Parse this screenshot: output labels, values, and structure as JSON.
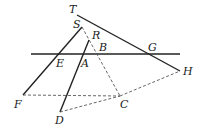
{
  "diagram": {
    "colors": {
      "line": "#222222",
      "dashed": "#555555",
      "background": "#ffffff"
    },
    "points": {
      "T": {
        "label": "T",
        "x": 77,
        "y": 15,
        "lx": 69,
        "ly": 13
      },
      "S": {
        "label": "S",
        "x": 82,
        "y": 27,
        "lx": 73,
        "ly": 28
      },
      "R": {
        "label": "R",
        "x": 89,
        "y": 40,
        "lx": 92,
        "ly": 39
      },
      "B": {
        "label": "B",
        "x": 97,
        "y": 54,
        "lx": 99,
        "ly": 51
      },
      "G": {
        "label": "G",
        "x": 151,
        "y": 54,
        "lx": 148,
        "ly": 51
      },
      "E": {
        "label": "E",
        "x": 59,
        "y": 54,
        "lx": 56,
        "ly": 67
      },
      "A": {
        "label": "A",
        "x": 83,
        "y": 54,
        "lx": 81,
        "ly": 67
      },
      "H": {
        "label": "H",
        "x": 180,
        "y": 71,
        "lx": 183,
        "ly": 75
      },
      "F": {
        "label": "F",
        "x": 23,
        "y": 95,
        "lx": 14,
        "ly": 108
      },
      "C": {
        "label": "C",
        "x": 120,
        "y": 96,
        "lx": 120,
        "ly": 108
      },
      "D": {
        "label": "D",
        "x": 60,
        "y": 112,
        "lx": 55,
        "ly": 124
      }
    },
    "solid_lines": [
      {
        "from": "T",
        "to": "H"
      },
      {
        "from": "S",
        "to": "F"
      },
      {
        "from": "R",
        "to": "D"
      },
      {
        "from": "horizontal-left",
        "to": "horizontal-right"
      }
    ],
    "dashed_lines": [
      {
        "from": "S",
        "to": "C"
      },
      {
        "from": "F",
        "to": "C"
      },
      {
        "from": "D",
        "to": "C"
      },
      {
        "from": "C",
        "to": "H"
      }
    ]
  }
}
